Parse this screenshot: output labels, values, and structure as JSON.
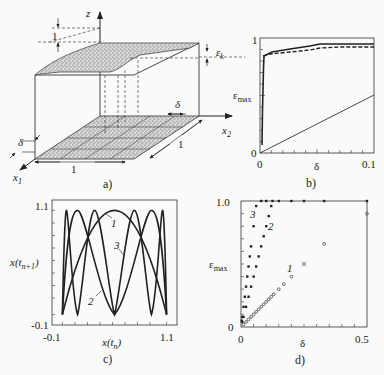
{
  "figure": {
    "panels": [
      {
        "id": "a",
        "caption": "a)"
      },
      {
        "id": "b",
        "caption": "b)"
      },
      {
        "id": "c",
        "caption": "c)"
      },
      {
        "id": "d",
        "caption": "d)"
      }
    ]
  },
  "panel_a": {
    "caption": "a)",
    "axis_z": "z",
    "axis_x1": "x",
    "axis_x1_sub": "1",
    "axis_x2": "x",
    "axis_x2_sub": "2",
    "height_label": "1",
    "epsilon_label": "ε",
    "epsilon_sub": "k",
    "delta_label_top": "δ",
    "delta_label_left": "δ",
    "width_label_front": "1",
    "width_label_side": "1"
  },
  "panel_b": {
    "caption": "b)",
    "ylabel": "ε",
    "ylabel_sub": "max",
    "xlabel": "δ",
    "y_tick_top": "1",
    "y_tick_bottom": "0",
    "x_tick_left": "0",
    "x_tick_right": "0.1"
  },
  "panel_c": {
    "caption": "c)",
    "ylabel": "x(t",
    "ylabel_sub": "n+1",
    "ylabel_close": ")",
    "xlabel": "x(t",
    "xlabel_sub": "n",
    "xlabel_close": ")",
    "y_tick_top": "1.1",
    "y_tick_bottom": "-0.1",
    "x_tick_left": "-0.1",
    "x_tick_right": "1.1",
    "curve_labels": [
      "1",
      "2",
      "3"
    ]
  },
  "panel_d": {
    "caption": "d)",
    "ylabel": "ε",
    "ylabel_sub": "max",
    "xlabel": "δ",
    "y_tick_top": "1.0",
    "y_tick_bottom": "0",
    "x_tick_left": "0",
    "x_tick_right": "0.5",
    "curve_labels": [
      "1",
      "2",
      "3"
    ]
  },
  "chart_data": [
    {
      "panel": "b",
      "type": "line",
      "title": "",
      "xlabel": "δ",
      "ylabel": "ε_max",
      "xlim": [
        0,
        0.1
      ],
      "ylim": [
        0,
        1
      ],
      "x_ticks": [
        "0",
        "0.1"
      ],
      "y_ticks": [
        "0",
        "1"
      ],
      "series": [
        {
          "name": "solid (upper)",
          "style": "solid-thick",
          "x": [
            0.001,
            0.002,
            0.003,
            0.005,
            0.01,
            0.03,
            0.05,
            0.07,
            0.1
          ],
          "y": [
            0.05,
            0.5,
            0.85,
            0.86,
            0.88,
            0.92,
            0.95,
            0.95,
            0.95
          ]
        },
        {
          "name": "dashed",
          "style": "dashed",
          "x": [
            0.003,
            0.005,
            0.01,
            0.03,
            0.05,
            0.07,
            0.1
          ],
          "y": [
            0.85,
            0.85,
            0.87,
            0.89,
            0.91,
            0.92,
            0.92
          ]
        },
        {
          "name": "linear (ε = δ)",
          "style": "solid-thin",
          "x": [
            0,
            0.1
          ],
          "y": [
            0,
            0.5
          ]
        }
      ]
    },
    {
      "panel": "c",
      "type": "line",
      "title": "",
      "xlabel": "x(t_n)",
      "ylabel": "x(t_n+1)",
      "xlim": [
        -0.1,
        1.1
      ],
      "ylim": [
        -0.1,
        1.1
      ],
      "x_ticks": [
        "-0.1",
        "1.1"
      ],
      "y_ticks": [
        "-0.1",
        "1.1"
      ],
      "series": [
        {
          "name": "1",
          "description": "logistic-type map, one hump, x_{n+1}=4x(1-x)",
          "x": [
            0,
            0.25,
            0.5,
            0.75,
            1
          ],
          "y": [
            0,
            0.75,
            1,
            0.75,
            0
          ]
        },
        {
          "name": "2",
          "description": "second iterate, two humps",
          "x": [
            0,
            0.146,
            0.5,
            0.854,
            1
          ],
          "y": [
            0,
            1,
            0,
            1,
            0
          ]
        },
        {
          "name": "3",
          "description": "third iterate, four humps",
          "x": [
            0,
            0.038,
            0.146,
            0.309,
            0.5,
            0.691,
            0.854,
            0.962,
            1
          ],
          "y": [
            0,
            1,
            0,
            1,
            0,
            1,
            0,
            1,
            0
          ]
        }
      ]
    },
    {
      "panel": "d",
      "type": "scatter",
      "title": "",
      "xlabel": "δ",
      "ylabel": "ε_max",
      "xlim": [
        0,
        0.5
      ],
      "ylim": [
        0,
        1.0
      ],
      "x_ticks": [
        "0",
        "0.5"
      ],
      "y_ticks": [
        "0",
        "1.0"
      ],
      "series": [
        {
          "name": "1",
          "marker": "open-circle",
          "x": [
            0.01,
            0.02,
            0.03,
            0.04,
            0.05,
            0.06,
            0.07,
            0.08,
            0.09,
            0.1,
            0.11,
            0.12,
            0.13,
            0.15,
            0.17,
            0.2,
            0.25,
            0.33,
            0.5
          ],
          "y": [
            0.02,
            0.04,
            0.06,
            0.08,
            0.1,
            0.12,
            0.14,
            0.16,
            0.18,
            0.2,
            0.22,
            0.24,
            0.26,
            0.3,
            0.34,
            0.4,
            0.5,
            0.66,
            0.9
          ]
        },
        {
          "name": "2",
          "marker": "filled-square",
          "x": [
            0.005,
            0.01,
            0.02,
            0.03,
            0.04,
            0.05,
            0.06,
            0.07,
            0.08,
            0.09,
            0.1,
            0.11,
            0.12,
            0.125,
            0.15,
            0.2,
            0.25,
            0.33,
            0.5
          ],
          "y": [
            0.04,
            0.08,
            0.16,
            0.24,
            0.32,
            0.4,
            0.48,
            0.56,
            0.64,
            0.72,
            0.8,
            0.88,
            0.96,
            1.0,
            1.0,
            1.0,
            1.0,
            1.0,
            1.0
          ]
        },
        {
          "name": "3",
          "marker": "filled-square",
          "x": [
            0.003,
            0.005,
            0.01,
            0.015,
            0.02,
            0.025,
            0.03,
            0.035,
            0.04,
            0.05,
            0.06,
            0.08,
            0.1
          ],
          "y": [
            0.05,
            0.08,
            0.16,
            0.24,
            0.32,
            0.4,
            0.48,
            0.56,
            0.64,
            0.8,
            0.96,
            1.0,
            1.0
          ]
        }
      ]
    }
  ]
}
